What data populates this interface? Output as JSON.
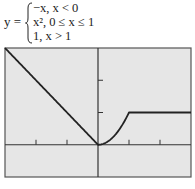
{
  "equation": {
    "lhs": "y =",
    "cases": [
      "−x, x < 0",
      "x², 0 ≤ x ≤ 1",
      "1, x > 1"
    ]
  },
  "colors": {
    "plot_bg": "#e6e6e6",
    "frame": "#555555",
    "axis": "#333333",
    "curve": "#222222"
  },
  "chart_data": {
    "type": "line",
    "xlabel": "",
    "ylabel": "",
    "xlim": [
      -3,
      3
    ],
    "ylim": [
      -1,
      3
    ],
    "x_ticks": [
      -2,
      -1,
      1,
      2
    ],
    "y_ticks": [
      1,
      2
    ],
    "grid": false,
    "legend": "none",
    "series": [
      {
        "name": "y = -x (x<0)",
        "x": [
          -3,
          -2,
          -1,
          0
        ],
        "y": [
          3,
          2,
          1,
          0
        ]
      },
      {
        "name": "y = x^2 (0<=x<=1)",
        "x": [
          0,
          0.25,
          0.5,
          0.75,
          1
        ],
        "y": [
          0,
          0.0625,
          0.25,
          0.5625,
          1
        ]
      },
      {
        "name": "y = 1 (x>1)",
        "x": [
          1,
          2,
          3
        ],
        "y": [
          1,
          1,
          1
        ]
      }
    ]
  }
}
